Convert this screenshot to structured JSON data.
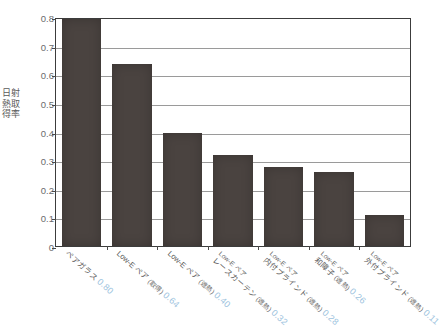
{
  "chart_data": {
    "type": "bar",
    "title": "",
    "xlabel": "",
    "ylabel": "日射熱取得率",
    "ylim": [
      0,
      0.8
    ],
    "grid": true,
    "legend": "none",
    "categories": [
      "ペアガラス",
      "Low-E ペア (取得)",
      "Low-E ペア (遮熱)",
      "レースカーテン Low-E ペア (遮熱)",
      "内付ブラインド Low-E ペア (遮熱)",
      "和障子 Low-E ペア (遮熱)",
      "外付ブラインド Low-E ペア (遮熱)"
    ],
    "values": [
      0.8,
      0.64,
      0.4,
      0.32,
      0.28,
      0.26,
      0.11
    ],
    "value_labels": [
      "0.80",
      "0.64",
      "0.40",
      "0.32",
      "0.28",
      "0.26",
      "0.11"
    ],
    "ytick_labels": [
      "0.8",
      "0.7",
      "0.6",
      "0.5",
      "0.4",
      "0.3",
      "0.2",
      "0.1",
      "0"
    ],
    "ytick_values": [
      0.8,
      0.7,
      0.6,
      0.5,
      0.4,
      0.3,
      0.2,
      0.1,
      0
    ],
    "colors": {
      "bar": "#4a4340",
      "value_label": "#9dc3de",
      "axis": "#3c3c3c",
      "grid": "#9a9a9a",
      "tick_text": "#6b6b6b",
      "background": "#ffffff"
    }
  },
  "xcategories": [
    {
      "line1": "ペアガラス",
      "line2": "",
      "value": "0.80"
    },
    {
      "line1": "Low-E ペア",
      "line2": "(取得)",
      "value": "0.64"
    },
    {
      "line1": "Low-E ペア",
      "line2": "(遮熱)",
      "value": "0.40"
    },
    {
      "line1": "レースカーテン",
      "line2": "(遮熱)",
      "line0": "Low-E ペア",
      "value": "0.32"
    },
    {
      "line1": "内付ブラインド",
      "line2": "(遮熱)",
      "line0": "Low-E ペア",
      "value": "0.28"
    },
    {
      "line1": "和障子",
      "line2": "(遮熱)",
      "line0": "Low-E ペア",
      "value": "0.26"
    },
    {
      "line1": "外付ブラインド",
      "line2": "(遮熱)",
      "line0": "Low-E ペア",
      "value": "0.11"
    }
  ]
}
